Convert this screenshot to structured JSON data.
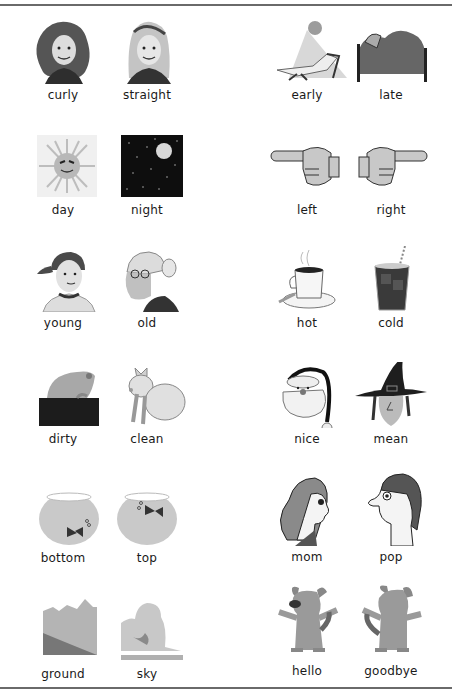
{
  "worksheet": {
    "left_column": [
      {
        "row": 1,
        "pair": [
          {
            "word": "curly",
            "icon": "curly-hair-girl-icon"
          },
          {
            "word": "straight",
            "icon": "straight-hair-girl-icon"
          }
        ]
      },
      {
        "row": 2,
        "pair": [
          {
            "word": "day",
            "icon": "sun-icon"
          },
          {
            "word": "night",
            "icon": "moon-stars-icon"
          }
        ]
      },
      {
        "row": 3,
        "pair": [
          {
            "word": "young",
            "icon": "young-boy-icon"
          },
          {
            "word": "old",
            "icon": "old-woman-icon"
          }
        ]
      },
      {
        "row": 4,
        "pair": [
          {
            "word": "dirty",
            "icon": "dirty-pig-icon"
          },
          {
            "word": "clean",
            "icon": "clean-pig-icon"
          }
        ]
      },
      {
        "row": 5,
        "pair": [
          {
            "word": "bottom",
            "icon": "fishbowl-bottom-icon"
          },
          {
            "word": "top",
            "icon": "fishbowl-top-icon"
          }
        ]
      },
      {
        "row": 6,
        "pair": [
          {
            "word": "ground",
            "icon": "ground-landscape-icon"
          },
          {
            "word": "sky",
            "icon": "sky-clouds-icon"
          }
        ]
      }
    ],
    "right_column": [
      {
        "row": 1,
        "pair": [
          {
            "word": "early",
            "icon": "sunbather-icon"
          },
          {
            "word": "late",
            "icon": "sleeping-bed-icon"
          }
        ]
      },
      {
        "row": 2,
        "pair": [
          {
            "word": "left",
            "icon": "hand-point-left-icon"
          },
          {
            "word": "right",
            "icon": "hand-point-right-icon"
          }
        ]
      },
      {
        "row": 3,
        "pair": [
          {
            "word": "hot",
            "icon": "hot-coffee-icon"
          },
          {
            "word": "cold",
            "icon": "cold-drink-icon"
          }
        ]
      },
      {
        "row": 4,
        "pair": [
          {
            "word": "nice",
            "icon": "santa-face-icon"
          },
          {
            "word": "mean",
            "icon": "witch-face-icon"
          }
        ]
      },
      {
        "row": 5,
        "pair": [
          {
            "word": "mom",
            "icon": "mom-profile-icon"
          },
          {
            "word": "pop",
            "icon": "pop-profile-icon"
          }
        ]
      },
      {
        "row": 6,
        "pair": [
          {
            "word": "hello",
            "icon": "dog-front-icon"
          },
          {
            "word": "goodbye",
            "icon": "dog-back-icon"
          }
        ]
      }
    ]
  },
  "colors": {
    "rule": "#6a6a6a",
    "text": "#1a1a1a",
    "art_gray": "#9a9a9a",
    "art_dark": "#3a3a3a"
  }
}
